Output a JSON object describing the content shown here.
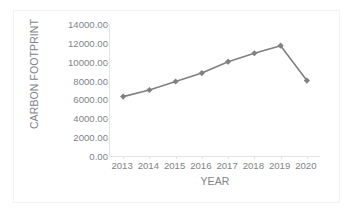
{
  "chart_data": {
    "type": "line",
    "title": "",
    "xlabel": "YEAR",
    "ylabel": "CARBON FOOTPRINT",
    "categories": [
      "2013",
      "2014",
      "2015",
      "2016",
      "2017",
      "2018",
      "2019",
      "2020"
    ],
    "values": [
      6300,
      7000,
      7900,
      8800,
      10000,
      10900,
      11700,
      8000
    ],
    "series": [
      {
        "name": "Carbon Footprint",
        "values": [
          6300,
          7000,
          7900,
          8800,
          10000,
          10900,
          11700,
          8000
        ]
      }
    ],
    "ylim": [
      0,
      14000
    ],
    "ytick_step": 2000,
    "ytick_labels": [
      "14000.00",
      "12000.00",
      "10000.00",
      "8000.00",
      "6000.00",
      "4000.00",
      "2000.00",
      "0.00"
    ],
    "ytick_values": [
      14000,
      12000,
      10000,
      8000,
      6000,
      4000,
      2000,
      0
    ],
    "xtick_labels": [
      "2013",
      "2014",
      "2015",
      "2016",
      "2017",
      "2018",
      "2019",
      "2020"
    ],
    "grid": false,
    "legend": "none",
    "marker": "diamond",
    "series_color": "#7f8083",
    "axis_color": "#e3e5e8",
    "text_color": "#808387",
    "plot_background": "#ffffff",
    "figure_border_color": "#f2f3f5"
  }
}
